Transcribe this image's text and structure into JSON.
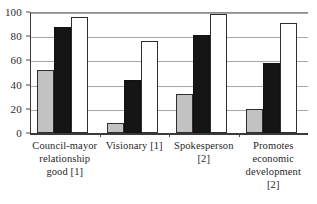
{
  "chart_data": {
    "type": "bar",
    "title": "",
    "subtitle": "",
    "xlabel": "",
    "ylabel": "",
    "ylim": [
      0,
      100
    ],
    "yticks": [
      0,
      20,
      40,
      60,
      80,
      100
    ],
    "ytick_labels": [
      "0",
      "20",
      "40",
      "60",
      "80",
      "100"
    ],
    "grid": true,
    "legend": "none",
    "legend_entries": [],
    "categories": [
      "Council-mayor relationship good [1]",
      "Visionary [1]",
      "Spokesperson [2]",
      "Promotes economic development [2]"
    ],
    "category_lines": [
      [
        "Council-mayor",
        "relationship",
        "good [1]"
      ],
      [
        "Visionary [1]"
      ],
      [
        "Spokesperson",
        "[2]"
      ],
      [
        "Promotes",
        "economic",
        "development",
        "[2]"
      ]
    ],
    "series": [
      {
        "name": "series-1",
        "color": "#c2c2c2",
        "values": [
          52,
          8,
          32,
          20
        ]
      },
      {
        "name": "series-2",
        "color": "#151515",
        "values": [
          88,
          44,
          81,
          58
        ]
      },
      {
        "name": "series-3",
        "color": "#ffffff",
        "values": [
          96,
          76,
          98,
          91
        ]
      }
    ]
  },
  "axis": {
    "y_max": 100,
    "y_min": 0
  },
  "colors": {
    "series_1": "#c2c2c2",
    "series_2": "#151515",
    "series_3": "#ffffff",
    "axis": "#3a3a3a",
    "grid": "#a8a8a8",
    "text": "#1f1f1f",
    "background": "#ffffff"
  }
}
